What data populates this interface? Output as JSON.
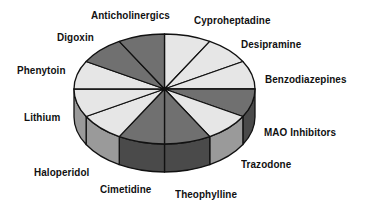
{
  "chart_data": {
    "type": "pie",
    "style": "3d-exploded-none",
    "title": "",
    "legend": "none (direct labels around pie)",
    "start_angle_deg": 90,
    "direction": "clockwise",
    "categories": [
      "Cyproheptadine",
      "Desipramine",
      "Benzodiazepines",
      "MAO Inhibitors",
      "Trazodone",
      "Theophylline",
      "Cimetidine",
      "Haloperidol",
      "Lithium",
      "Phenytoin",
      "Digoxin",
      "Anticholinergics"
    ],
    "values": [
      1,
      1,
      1,
      1,
      1,
      1,
      1,
      1,
      1,
      1,
      1,
      1
    ],
    "shades": [
      "light",
      "light",
      "light",
      "dark",
      "light",
      "dark",
      "dark",
      "light",
      "light",
      "light",
      "dark",
      "dark"
    ]
  },
  "colors": {
    "light_top": "#e6e6e6",
    "dark_top": "#707070",
    "light_side": "#9a9a9a",
    "dark_side": "#4a4a4a",
    "outline": "#111111",
    "background": "#ffffff"
  },
  "labels": {
    "anticholinergics": "Anticholinergics",
    "cyproheptadine": "Cyproheptadine",
    "digoxin": "Digoxin",
    "desipramine": "Desipramine",
    "phenytoin": "Phenytoin",
    "benzodiazepines": "Benzodiazepines",
    "lithium": "Lithium",
    "mao_inhibitors": "MAO Inhibitors",
    "haloperidol": "Haloperidol",
    "trazodone": "Trazodone",
    "cimetidine": "Cimetidine",
    "theophylline": "Theophylline"
  }
}
